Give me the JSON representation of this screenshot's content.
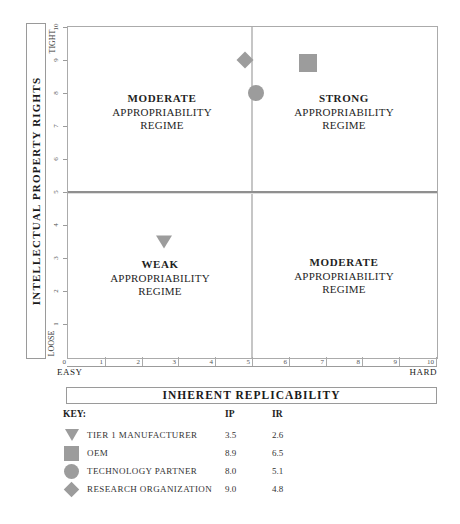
{
  "chart_data": {
    "type": "scatter",
    "marker_color": "#9c9c9c",
    "x_axis": {
      "label": "INHERENT REPLICABILITY",
      "min": 0,
      "max": 10,
      "ticks": [
        "0",
        "1",
        "2",
        "3",
        "4",
        "5",
        "6",
        "7",
        "8",
        "9",
        "10"
      ],
      "min_end_label": "EASY",
      "max_end_label": "HARD"
    },
    "y_axis": {
      "label": "INTELLECTUAL PROPERTY RIGHTS",
      "min": 0,
      "max": 10,
      "ticks": [
        "1",
        "2",
        "3",
        "4",
        "5",
        "6",
        "7",
        "8",
        "9",
        "10"
      ],
      "min_end_label": "LOOSE",
      "max_end_label": "TIGHT"
    },
    "quadrants": {
      "top_left": {
        "line1": "MODERATE",
        "line2": "APPROPRIABILITY",
        "line3": "REGIME"
      },
      "top_right": {
        "line1": "STRONG",
        "line2": "APPROPRIABILITY",
        "line3": "REGIME"
      },
      "bottom_left": {
        "line1": "WEAK",
        "line2": "APPROPRIABILITY",
        "line3": "REGIME"
      },
      "bottom_right": {
        "line1": "MODERATE",
        "line2": "APPROPRIABILITY",
        "line3": "REGIME"
      }
    },
    "series": [
      {
        "name": "TIER 1 MANUFACTURER",
        "marker": "triangle-down",
        "ip": "3.5",
        "ir": "2.6"
      },
      {
        "name": "OEM",
        "marker": "square",
        "ip": "8.9",
        "ir": "6.5"
      },
      {
        "name": "TECHNOLOGY PARTNER",
        "marker": "circle",
        "ip": "8.0",
        "ir": "5.1"
      },
      {
        "name": "RESEARCH ORGANIZATION",
        "marker": "diamond",
        "ip": "9.0",
        "ir": "4.8"
      }
    ]
  },
  "key": {
    "heading": "KEY:",
    "col_ip": "IP",
    "col_ir": "IR"
  }
}
